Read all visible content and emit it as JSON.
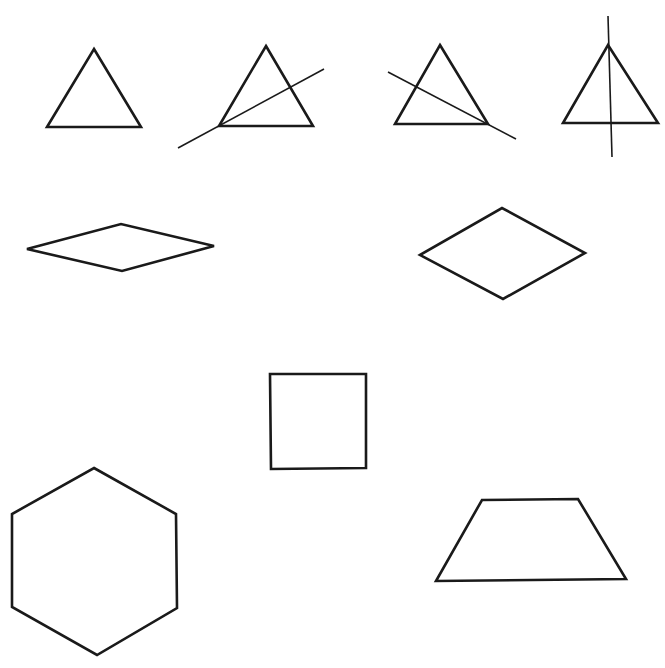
{
  "figure": {
    "width": 665,
    "height": 668,
    "background": "#ffffff",
    "stroke_color": "#1a1a1a"
  },
  "shapes": [
    {
      "id": "triangle-plain",
      "kind": "equilateral-triangle",
      "points": "94,49 141,127 47,127",
      "symmetry_line": null
    },
    {
      "id": "triangle-line-left-vertex",
      "kind": "equilateral-triangle",
      "points": "266,46 313,126 219,126",
      "symmetry_line": {
        "x1": 178,
        "y1": 148,
        "x2": 324,
        "y2": 69
      }
    },
    {
      "id": "triangle-line-right-vertex",
      "kind": "equilateral-triangle",
      "points": "440,45 488,124 395,124",
      "symmetry_line": {
        "x1": 388,
        "y1": 72,
        "x2": 516,
        "y2": 139
      }
    },
    {
      "id": "triangle-line-top-vertex",
      "kind": "equilateral-triangle",
      "points": "608,45 658,123 563,123",
      "symmetry_line": {
        "x1": 608,
        "y1": 16,
        "x2": 612,
        "y2": 157
      }
    },
    {
      "id": "rhombus-flat",
      "kind": "rhombus",
      "points": "27,249 121,224 214,246 122,271"
    },
    {
      "id": "rhombus-tall",
      "kind": "rhombus",
      "points": "420,255 502,208 585,253 503,299"
    },
    {
      "id": "square",
      "kind": "square",
      "points": "270,374 366,374 366,468 271,469"
    },
    {
      "id": "hexagon",
      "kind": "regular-hexagon",
      "points": "94,468 176,514 177,608 97,655 12,607 12,514"
    },
    {
      "id": "trapezoid",
      "kind": "isosceles-trapezoid",
      "points": "482,500 578,499 626,579 436,581"
    }
  ]
}
